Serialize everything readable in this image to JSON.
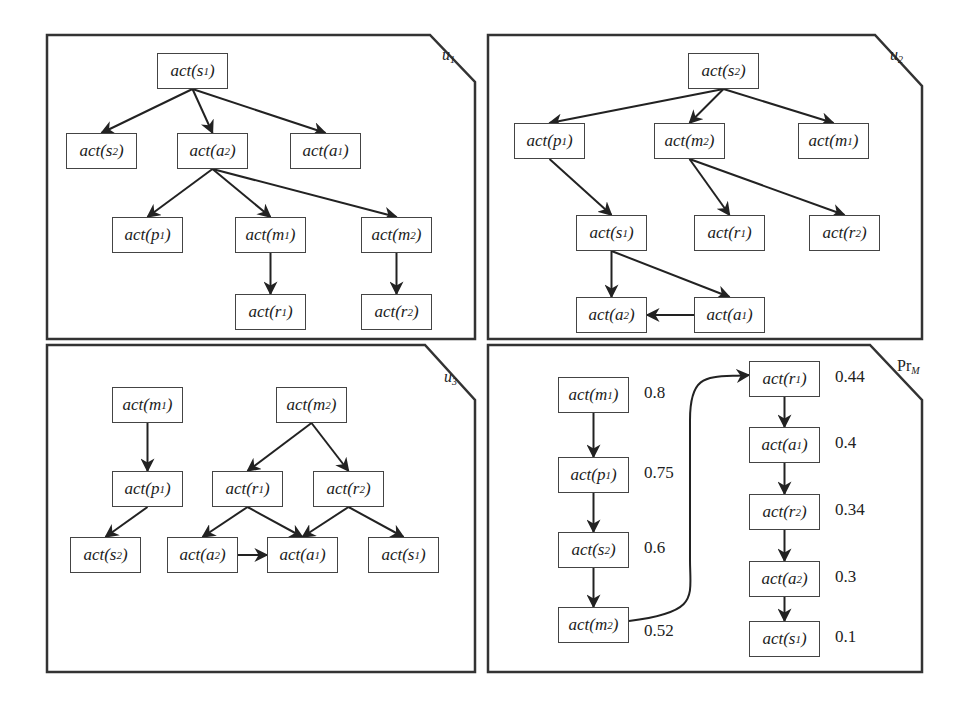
{
  "figure": {
    "panels": [
      {
        "id": "u1",
        "label": "u",
        "label_sub": "1",
        "nodes": [
          {
            "id": "s1",
            "text": "act(",
            "var": "s",
            "sub": "1"
          },
          {
            "id": "s2",
            "text": "act(",
            "var": "s",
            "sub": "2"
          },
          {
            "id": "a2",
            "text": "act(",
            "var": "a",
            "sub": "2"
          },
          {
            "id": "a1",
            "text": "act(",
            "var": "a",
            "sub": "1"
          },
          {
            "id": "p1",
            "text": "act(",
            "var": "p",
            "sub": "1"
          },
          {
            "id": "m1",
            "text": "act(",
            "var": "m",
            "sub": "1"
          },
          {
            "id": "m2",
            "text": "act(",
            "var": "m",
            "sub": "2"
          },
          {
            "id": "r1",
            "text": "act(",
            "var": "r",
            "sub": "1"
          },
          {
            "id": "r2",
            "text": "act(",
            "var": "r",
            "sub": "2"
          }
        ],
        "edges": [
          [
            "s1",
            "s2"
          ],
          [
            "s1",
            "a2"
          ],
          [
            "s1",
            "a1"
          ],
          [
            "a2",
            "p1"
          ],
          [
            "a2",
            "m1"
          ],
          [
            "a2",
            "m2"
          ],
          [
            "m1",
            "r1"
          ],
          [
            "m2",
            "r2"
          ]
        ]
      },
      {
        "id": "u2",
        "label": "u",
        "label_sub": "2",
        "nodes": [
          {
            "id": "s2",
            "text": "act(",
            "var": "s",
            "sub": "2"
          },
          {
            "id": "p1",
            "text": "act(",
            "var": "p",
            "sub": "1"
          },
          {
            "id": "m2",
            "text": "act(",
            "var": "m",
            "sub": "2"
          },
          {
            "id": "m1",
            "text": "act(",
            "var": "m",
            "sub": "1"
          },
          {
            "id": "s1",
            "text": "act(",
            "var": "s",
            "sub": "1"
          },
          {
            "id": "r1",
            "text": "act(",
            "var": "r",
            "sub": "1"
          },
          {
            "id": "r2",
            "text": "act(",
            "var": "r",
            "sub": "2"
          },
          {
            "id": "a2",
            "text": "act(",
            "var": "a",
            "sub": "2"
          },
          {
            "id": "a1",
            "text": "act(",
            "var": "a",
            "sub": "1"
          }
        ],
        "edges": [
          [
            "s2",
            "p1"
          ],
          [
            "s2",
            "m2"
          ],
          [
            "s2",
            "m1"
          ],
          [
            "p1",
            "s1"
          ],
          [
            "m2",
            "r1"
          ],
          [
            "m2",
            "r2"
          ],
          [
            "s1",
            "a2"
          ],
          [
            "s1",
            "a1"
          ],
          [
            "a1",
            "a2"
          ]
        ]
      },
      {
        "id": "u3",
        "label": "u",
        "label_sub": "3",
        "nodes": [
          {
            "id": "m1",
            "text": "act(",
            "var": "m",
            "sub": "1"
          },
          {
            "id": "m2",
            "text": "act(",
            "var": "m",
            "sub": "2"
          },
          {
            "id": "p1",
            "text": "act(",
            "var": "p",
            "sub": "1"
          },
          {
            "id": "r1",
            "text": "act(",
            "var": "r",
            "sub": "1"
          },
          {
            "id": "r2",
            "text": "act(",
            "var": "r",
            "sub": "2"
          },
          {
            "id": "s2",
            "text": "act(",
            "var": "s",
            "sub": "2"
          },
          {
            "id": "a2",
            "text": "act(",
            "var": "a",
            "sub": "2"
          },
          {
            "id": "a1",
            "text": "act(",
            "var": "a",
            "sub": "1"
          },
          {
            "id": "s1",
            "text": "act(",
            "var": "s",
            "sub": "1"
          }
        ],
        "edges": [
          [
            "m1",
            "p1"
          ],
          [
            "m2",
            "r1"
          ],
          [
            "m2",
            "r2"
          ],
          [
            "p1",
            "s2"
          ],
          [
            "r1",
            "a2"
          ],
          [
            "r1",
            "a1"
          ],
          [
            "r2",
            "a1"
          ],
          [
            "r2",
            "s1"
          ],
          [
            "a2",
            "a1"
          ]
        ]
      },
      {
        "id": "PrM",
        "label": "Pr",
        "label_sub": "M",
        "nodes": [
          {
            "id": "m1",
            "text": "act(",
            "var": "m",
            "sub": "1",
            "prob": "0.8"
          },
          {
            "id": "p1",
            "text": "act(",
            "var": "p",
            "sub": "1",
            "prob": "0.75"
          },
          {
            "id": "s2",
            "text": "act(",
            "var": "s",
            "sub": "2",
            "prob": "0.6"
          },
          {
            "id": "m2",
            "text": "act(",
            "var": "m",
            "sub": "2",
            "prob": "0.52"
          },
          {
            "id": "r1",
            "text": "act(",
            "var": "r",
            "sub": "1",
            "prob": "0.44"
          },
          {
            "id": "a1",
            "text": "act(",
            "var": "a",
            "sub": "1",
            "prob": "0.4"
          },
          {
            "id": "r2",
            "text": "act(",
            "var": "r",
            "sub": "2",
            "prob": "0.34"
          },
          {
            "id": "a2",
            "text": "act(",
            "var": "a",
            "sub": "2",
            "prob": "0.3"
          },
          {
            "id": "s1",
            "text": "act(",
            "var": "s",
            "sub": "1",
            "prob": "0.1"
          }
        ],
        "edges": [
          [
            "m1",
            "p1"
          ],
          [
            "p1",
            "s2"
          ],
          [
            "s2",
            "m2"
          ],
          [
            "m2",
            "r1"
          ],
          [
            "r1",
            "a1"
          ],
          [
            "a1",
            "r2"
          ],
          [
            "r2",
            "a2"
          ],
          [
            "a2",
            "s1"
          ]
        ]
      }
    ]
  }
}
